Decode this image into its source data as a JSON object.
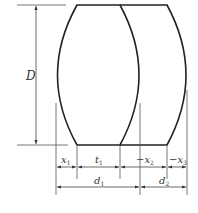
{
  "diagram": {
    "type": "lens-cross-section-dimension-drawing",
    "elements": [
      "lens-1 (biconvex)",
      "lens-2 (meniscus/convex back)"
    ],
    "colors": {
      "stroke": "#222222",
      "dim_line": "#555555",
      "text": "#333333",
      "background": "#ffffff"
    }
  },
  "labels": {
    "diameter": "D",
    "x1": {
      "base": "x",
      "sub": "1",
      "prefix": ""
    },
    "t1": {
      "base": "t",
      "sub": "1",
      "prefix": ""
    },
    "x2": {
      "base": "x",
      "sub": "2",
      "prefix": "−"
    },
    "x3": {
      "base": "x",
      "sub": "3",
      "prefix": "−"
    },
    "d1": {
      "base": "d",
      "sub": "1",
      "prefix": ""
    },
    "d2": {
      "base": "d",
      "sub": "2",
      "prefix": ""
    }
  }
}
